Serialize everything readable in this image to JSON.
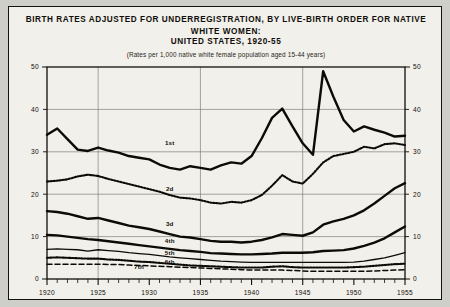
{
  "header": {
    "title_line1": "BIRTH RATES ADJUSTED FOR UNDERREGISTRATION, BY LIVE-BIRTH ORDER FOR NATIVE WHITE WOMEN:",
    "title_line2": "UNITED STATES, 1920-55",
    "subtitle": "(Rates per 1,000 native white female population aged 15-44 years)"
  },
  "chart_data": {
    "type": "line",
    "title": "BIRTH RATES ADJUSTED FOR UNDERREGISTRATION, BY LIVE-BIRTH ORDER FOR NATIVE WHITE WOMEN: UNITED STATES, 1920-55",
    "subtitle": "(Rates per 1,000 native white female population aged 15-44 years)",
    "xlabel": "",
    "ylabel": "",
    "xlim": [
      1920,
      1955
    ],
    "ylim": [
      0,
      50
    ],
    "yticks": [
      0,
      10,
      20,
      30,
      40,
      50
    ],
    "xticks": [
      1920,
      1925,
      1930,
      1935,
      1940,
      1945,
      1950,
      1955
    ],
    "xtick_labels": [
      "1920",
      "1925",
      "1930",
      "1935",
      "1940",
      "1945",
      "1950",
      "1955"
    ],
    "ytick_labels": [
      "0",
      "10",
      "20",
      "30",
      "40",
      "50"
    ],
    "minor_xticks_every": 1,
    "grid": true,
    "grid_x_years": [
      1925,
      1935,
      1945,
      1955
    ],
    "grid_y_values": [
      10,
      20,
      30,
      40,
      50
    ],
    "right_axis_labels": true,
    "legend": "inline-labels",
    "x": [
      1920,
      1921,
      1922,
      1923,
      1924,
      1925,
      1926,
      1927,
      1928,
      1929,
      1930,
      1931,
      1932,
      1933,
      1934,
      1935,
      1936,
      1937,
      1938,
      1939,
      1940,
      1941,
      1942,
      1943,
      1944,
      1945,
      1946,
      1947,
      1948,
      1949,
      1950,
      1951,
      1952,
      1953,
      1954,
      1955
    ],
    "series": [
      {
        "name": "1st",
        "label": "1st",
        "style": "solid-thick",
        "label_x": 1932,
        "label_y": 31.5,
        "values": [
          34.0,
          35.5,
          33.0,
          30.5,
          30.2,
          31.0,
          30.3,
          29.8,
          29.0,
          28.6,
          28.2,
          27.0,
          26.2,
          25.8,
          26.6,
          26.2,
          25.8,
          26.8,
          27.5,
          27.2,
          29.0,
          33.2,
          38.0,
          40.2,
          36.0,
          32.0,
          29.3,
          49.0,
          43.0,
          37.5,
          34.8,
          36.0,
          35.2,
          34.5,
          33.6,
          33.8
        ]
      },
      {
        "name": "2d",
        "label": "2d",
        "style": "dotted",
        "label_x": 1932,
        "label_y": 20.8,
        "values": [
          23.0,
          23.2,
          23.5,
          24.2,
          24.6,
          24.3,
          23.6,
          23.0,
          22.4,
          21.8,
          21.2,
          20.6,
          19.8,
          19.2,
          19.0,
          18.6,
          18.0,
          17.8,
          18.2,
          18.0,
          18.6,
          19.8,
          22.0,
          24.5,
          23.0,
          22.5,
          24.8,
          27.5,
          29.0,
          29.5,
          30.0,
          31.2,
          30.8,
          31.8,
          32.0,
          31.6
        ]
      },
      {
        "name": "3d",
        "label": "3d",
        "style": "solid-thick",
        "label_x": 1932,
        "label_y": 12.6,
        "values": [
          16.0,
          15.8,
          15.4,
          14.8,
          14.2,
          14.4,
          13.8,
          13.2,
          12.6,
          12.2,
          11.8,
          11.2,
          10.6,
          10.0,
          9.8,
          9.4,
          9.0,
          8.8,
          8.8,
          8.6,
          8.8,
          9.2,
          9.8,
          10.6,
          10.4,
          10.2,
          11.0,
          12.8,
          13.6,
          14.2,
          15.0,
          16.2,
          17.8,
          19.6,
          21.4,
          22.6
        ]
      },
      {
        "name": "4th",
        "label": "4th",
        "style": "solid-thick",
        "label_x": 1932,
        "label_y": 8.6,
        "values": [
          10.4,
          10.3,
          10.0,
          9.7,
          9.4,
          9.2,
          8.9,
          8.6,
          8.3,
          8.0,
          7.7,
          7.4,
          7.1,
          6.8,
          6.6,
          6.4,
          6.1,
          6.0,
          5.9,
          5.8,
          5.8,
          5.9,
          6.0,
          6.2,
          6.2,
          6.2,
          6.3,
          6.6,
          6.7,
          6.8,
          7.2,
          7.8,
          8.6,
          9.6,
          11.0,
          12.4
        ]
      },
      {
        "name": "5th",
        "label": "5th",
        "style": "solid-thin",
        "label_x": 1932,
        "label_y": 5.6,
        "values": [
          7.0,
          7.1,
          7.0,
          6.9,
          6.6,
          6.9,
          6.7,
          6.5,
          6.2,
          6.0,
          5.8,
          5.5,
          5.2,
          5.0,
          4.8,
          4.6,
          4.4,
          4.2,
          4.1,
          4.0,
          3.9,
          3.9,
          3.9,
          3.9,
          3.9,
          3.9,
          3.9,
          3.9,
          3.9,
          3.9,
          4.0,
          4.2,
          4.6,
          5.0,
          5.6,
          6.2
        ]
      },
      {
        "name": "6th",
        "label": "6th",
        "style": "dotted",
        "label_x": 1932,
        "label_y": 3.6,
        "values": [
          5.0,
          5.1,
          5.0,
          4.9,
          4.8,
          4.8,
          4.6,
          4.5,
          4.3,
          4.1,
          4.0,
          3.8,
          3.6,
          3.4,
          3.2,
          3.1,
          3.0,
          2.9,
          2.8,
          2.7,
          2.7,
          2.7,
          2.9,
          3.0,
          2.8,
          2.7,
          2.7,
          2.7,
          2.7,
          2.7,
          2.8,
          2.9,
          3.1,
          3.3,
          3.5,
          3.6
        ]
      },
      {
        "name": "7th",
        "label": "7th",
        "style": "dashed",
        "label_x": 1929,
        "label_y": 2.3,
        "values": [
          3.5,
          3.5,
          3.5,
          3.5,
          3.5,
          3.5,
          3.4,
          3.4,
          3.3,
          3.2,
          3.1,
          3.0,
          2.9,
          2.8,
          2.7,
          2.6,
          2.5,
          2.4,
          2.3,
          2.2,
          2.1,
          2.1,
          2.1,
          2.1,
          2.0,
          1.9,
          1.8,
          1.8,
          1.8,
          1.8,
          1.8,
          1.8,
          1.9,
          2.0,
          2.1,
          2.2
        ]
      }
    ]
  }
}
